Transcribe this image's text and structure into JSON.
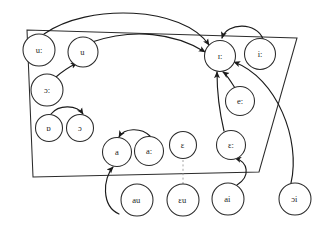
{
  "diagram": {
    "kind": "vowel-quadrilateral-with-shift-arrows",
    "orientation": "mirrored-horizontally",
    "colors": {
      "stroke": "#2b2b2b",
      "arrow": "#1b1b1b",
      "background": "#ffffff",
      "dashed_guide": "#9a9a9a"
    },
    "quadrilateral": {
      "name": "vowel-quadrilateral",
      "points": "26,38 296,30 290,177 64,172"
    },
    "nodes": [
      {
        "id": "n1",
        "label": "iː",
        "cx": 63,
        "cy": 54,
        "r": 15.5
      },
      {
        "id": "n2",
        "label": "ɪː",
        "cx": 103,
        "cy": 56,
        "r": 15.5
      },
      {
        "id": "n3",
        "label": "eː",
        "cx": 83,
        "cy": 101,
        "r": 14.5
      },
      {
        "id": "n4",
        "label": "ɛː",
        "cx": 92,
        "cy": 145,
        "r": 14.5
      },
      {
        "id": "n5",
        "label": "ɛ",
        "cx": 140,
        "cy": 145,
        "r": 13.5
      },
      {
        "id": "n6",
        "label": "aː",
        "cx": 174,
        "cy": 151,
        "r": 14.5
      },
      {
        "id": "n7",
        "label": "a",
        "cx": 206,
        "cy": 152,
        "r": 14.5
      },
      {
        "id": "n8",
        "label": "u",
        "cx": 240,
        "cy": 52,
        "r": 15.0
      },
      {
        "id": "n9",
        "label": "uː",
        "cx": 284,
        "cy": 50,
        "r": 16.0
      },
      {
        "id": "n10",
        "label": "ɔː",
        "cx": 276,
        "cy": 90,
        "r": 16.0
      },
      {
        "id": "n11",
        "label": "ɔ",
        "cx": 243,
        "cy": 128,
        "r": 13.5
      },
      {
        "id": "n12",
        "label": "ɒ",
        "cx": 274,
        "cy": 128,
        "r": 13.5
      },
      {
        "id": "n13",
        "label": "ɔi",
        "cx": 28,
        "cy": 199,
        "r": 16.0
      },
      {
        "id": "n14",
        "label": "ai",
        "cx": 95,
        "cy": 199,
        "r": 16.0
      },
      {
        "id": "n15",
        "label": "ɛu",
        "cx": 140,
        "cy": 200,
        "r": 16.0
      },
      {
        "id": "n16",
        "label": "au",
        "cx": 186,
        "cy": 200,
        "r": 16.0
      }
    ],
    "arrows": [
      {
        "id": "a1",
        "name": "arrow-ii-to-ih",
        "from": "iː",
        "to": "ɪː"
      },
      {
        "id": "a2",
        "name": "arrow-ee-to-ih",
        "from": "eː",
        "to": "ɪː"
      },
      {
        "id": "a3",
        "name": "arrow-eh-to-ih",
        "from": "ɛː",
        "to": "ɪː"
      },
      {
        "id": "a4",
        "name": "arrow-ai-to-eh",
        "from": "ai",
        "to": "ɛː"
      },
      {
        "id": "a5",
        "name": "arrow-oi-to-ih",
        "from": "ɔi",
        "to": "ɪː"
      },
      {
        "id": "a6",
        "name": "arrow-uu-to-ih",
        "from": "uː",
        "to": "ɪː"
      },
      {
        "id": "a7",
        "name": "arrow-u-to-ih",
        "from": "u",
        "to": "ɪː"
      },
      {
        "id": "a8",
        "name": "arrow-oo-to-u",
        "from": "ɔː",
        "to": "u"
      },
      {
        "id": "a9",
        "name": "arrow-oh-to-o",
        "from": "ɒ",
        "to": "ɔ"
      },
      {
        "id": "a10",
        "name": "arrow-aa-to-a",
        "from": "aː",
        "to": "a"
      },
      {
        "id": "a11",
        "name": "arrow-au-to-a",
        "from": "au",
        "to": "a"
      },
      {
        "id": "a12",
        "name": "guide-eu-to-eh",
        "from": "ɛu",
        "to": "ɛ"
      }
    ]
  }
}
